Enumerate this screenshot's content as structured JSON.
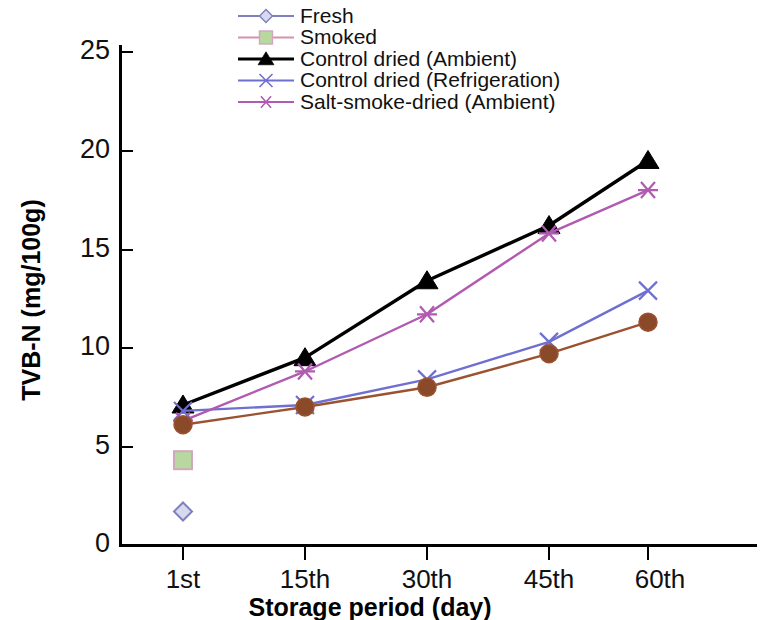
{
  "chart_data": {
    "type": "line",
    "title": "",
    "xlabel": "Storage period (day)",
    "ylabel": "TVB-N (mg/100g)",
    "categories": [
      "1st",
      "15th",
      "30th",
      "45th",
      "60th"
    ],
    "yticks": [
      0,
      5,
      10,
      15,
      20,
      25
    ],
    "ylim": [
      0,
      25
    ],
    "grid": false,
    "legend_position": "top-center",
    "series": [
      {
        "name": "Fresh",
        "color": "#8080c0",
        "marker": "diamond",
        "marker_fill": "#d8d8ee",
        "values": [
          1.7,
          null,
          null,
          null,
          null
        ]
      },
      {
        "name": "Smoked",
        "color": "#d890b0",
        "marker": "square",
        "marker_fill": "#b8d8a0",
        "values": [
          4.3,
          null,
          null,
          null,
          null
        ]
      },
      {
        "name": "Control dried (Ambient)",
        "color": "#000000",
        "marker": "triangle",
        "marker_fill": "#000000",
        "values": [
          7.1,
          9.5,
          13.4,
          16.2,
          19.5
        ]
      },
      {
        "name": "Control dried (Refrigeration)",
        "color": "#6f6fd0",
        "marker": "x",
        "marker_fill": "#6f6fd0",
        "values": [
          6.8,
          7.1,
          8.4,
          10.3,
          12.9
        ]
      },
      {
        "name": "Salt-smoke-dried (Ambient)",
        "color": "#b05ab0",
        "marker": "asterisk",
        "marker_fill": "#b05ab0",
        "values": [
          6.3,
          8.8,
          11.7,
          15.8,
          18.0
        ]
      },
      {
        "name": "Smoked-dried",
        "color": "#9a5230",
        "marker": "circle",
        "marker_fill": "#8a4a2a",
        "values": [
          6.1,
          7.0,
          8.0,
          9.7,
          11.3
        ]
      }
    ]
  },
  "legend": {
    "items": [
      {
        "label": "Fresh"
      },
      {
        "label": "Smoked"
      },
      {
        "label": "Control dried (Ambient)"
      },
      {
        "label": "Control dried (Refrigeration)"
      },
      {
        "label": "Salt-smoke-dried (Ambient)"
      }
    ]
  },
  "axes": {
    "y_title": "TVB-N (mg/100g)",
    "x_title": "Storage period (day)",
    "y_tick_labels": [
      "25",
      "20",
      "15",
      "10",
      "5",
      "0"
    ],
    "x_tick_labels": [
      "1st",
      "15th",
      "30th",
      "45th",
      "60th"
    ]
  }
}
